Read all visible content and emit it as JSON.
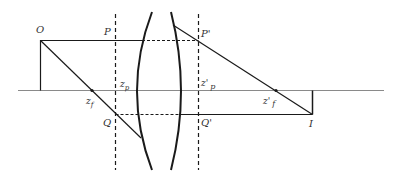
{
  "diagram": {
    "type": "thick-lens-ray-diagram",
    "labels": {
      "object": "O",
      "principal_point_front": "P",
      "principal_point_back": "P'",
      "front_principal_plane_axis": "z",
      "front_principal_plane_sub": "p",
      "back_principal_plane_axis": "z'",
      "back_principal_plane_sub": "p",
      "front_focus": "z",
      "front_focus_sub": "f",
      "back_focus": "z'",
      "back_focus_sub": "f",
      "lower_front": "Q",
      "lower_back": "Q'",
      "image": "I"
    },
    "colors": {
      "line": "#1a1a1a",
      "axis": "#808080",
      "label": "#333333"
    }
  }
}
